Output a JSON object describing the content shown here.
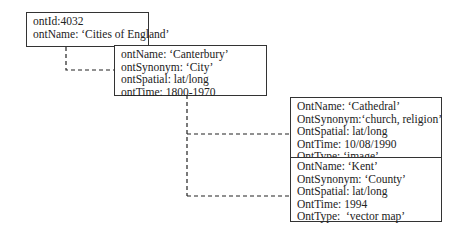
{
  "diagram": {
    "nodes": [
      {
        "id": "root",
        "lines": [
          "ontId:4032",
          "ontName: ‘Cities of England’"
        ]
      },
      {
        "id": "canterbury",
        "lines": [
          "ontName: ‘Canterbury’",
          "ontSynonym: ‘City’",
          "ontSpatial: lat/long",
          "ontTime: 1800-1970"
        ]
      },
      {
        "id": "cathedral",
        "lines": [
          "OntName: ‘Cathedral’",
          "OntSynonym:‘church, religion’",
          "OntSpatial: lat/long",
          "OntTime: 10/08/1990",
          "OntType: ‘image’"
        ]
      },
      {
        "id": "kent",
        "lines": [
          "OntName: ‘Kent’",
          "OntSynonym: ‘County’",
          "OntSpatial: lat/long",
          "OntTime: 1994",
          "OntType:  ‘vector map’"
        ]
      }
    ],
    "edges": [
      {
        "from": "root",
        "to": "canterbury",
        "style": "dashed"
      },
      {
        "from": "canterbury",
        "to": "cathedral",
        "style": "dashed"
      },
      {
        "from": "canterbury",
        "to": "kent",
        "style": "dashed"
      }
    ]
  }
}
